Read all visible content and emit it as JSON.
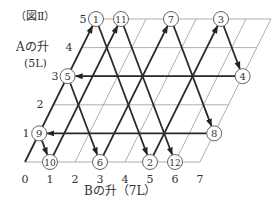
{
  "figure_label": "（図Ⅱ）",
  "y_axis": {
    "label": "Aの升",
    "capacity": "(5L)",
    "ticks": [
      "1",
      "2",
      "3",
      "4",
      "5"
    ]
  },
  "x_axis": {
    "label": "Bの升（7L）",
    "ticks": [
      "0",
      "1",
      "2",
      "3",
      "4",
      "5",
      "6",
      "7"
    ]
  },
  "grid": {
    "cols": 7,
    "rows": 5,
    "origin": [
      25,
      162
    ],
    "col_step_x": 25,
    "row_step_x": 14.2,
    "row_step_y": 28.6,
    "grid_color": "#9a9a9a",
    "path_color": "#2a2a2a"
  },
  "states": [
    {
      "n": "1",
      "b": 0,
      "a": 5
    },
    {
      "n": "2",
      "b": 5,
      "a": 0
    },
    {
      "n": "3",
      "b": 5,
      "a": 5
    },
    {
      "n": "4",
      "b": 7,
      "a": 3
    },
    {
      "n": "5",
      "b": 0,
      "a": 3
    },
    {
      "n": "6",
      "b": 3,
      "a": 0
    },
    {
      "n": "7",
      "b": 3,
      "a": 5
    },
    {
      "n": "8",
      "b": 7,
      "a": 1
    },
    {
      "n": "9",
      "b": 0,
      "a": 1
    },
    {
      "n": "10",
      "b": 1,
      "a": 0
    },
    {
      "n": "11",
      "b": 1,
      "a": 5
    },
    {
      "n": "12",
      "b": 6,
      "a": 0
    }
  ],
  "path": [
    [
      0,
      0
    ],
    [
      0,
      5
    ],
    [
      5,
      0
    ],
    [
      5,
      5
    ],
    [
      7,
      3
    ],
    [
      0,
      3
    ],
    [
      3,
      0
    ],
    [
      3,
      5
    ],
    [
      7,
      1
    ],
    [
      0,
      1
    ],
    [
      1,
      0
    ],
    [
      1,
      5
    ],
    [
      6,
      0
    ]
  ]
}
